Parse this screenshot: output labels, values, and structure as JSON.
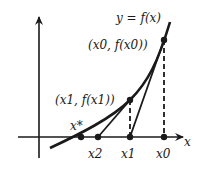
{
  "diagram": {
    "curve_label": "y = f(x)",
    "axis_x_label": "x",
    "point_labels": {
      "p0": "(x0, f(x0))",
      "p1": "(x1, f(x1))"
    },
    "axis_ticks": {
      "root": "x*",
      "x2": "x2",
      "x1": "x1",
      "x0": "x0"
    },
    "colors": {
      "stroke": "#1a1a1a",
      "background": "#ffffff"
    }
  }
}
